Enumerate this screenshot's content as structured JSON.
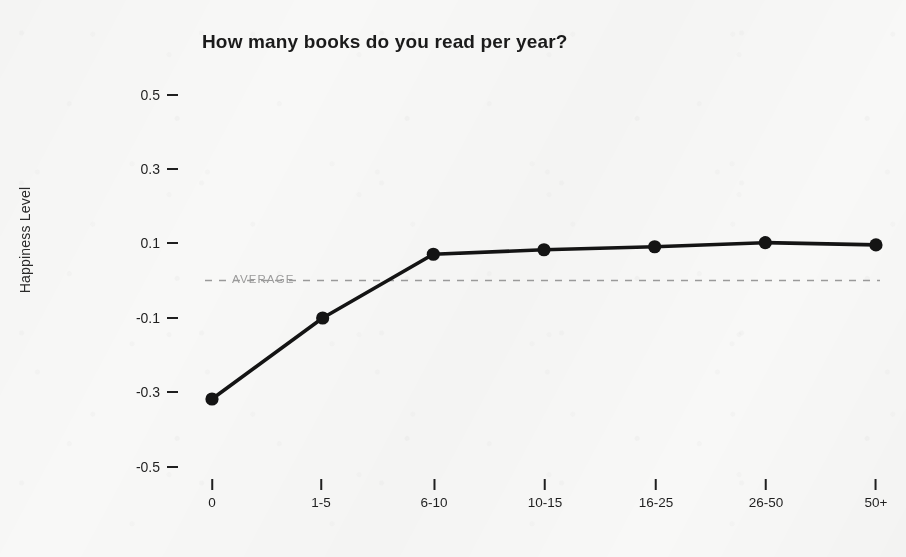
{
  "chart_data": {
    "type": "line",
    "title": "How many books do you read per year?",
    "xlabel": "",
    "ylabel": "Happiness Level",
    "categories": [
      "0",
      "1-5",
      "6-10",
      "10-15",
      "16-25",
      "26-50",
      "50+"
    ],
    "values": [
      -0.316,
      -0.1,
      0.07,
      0.082,
      0.09,
      0.101,
      0.095
    ],
    "series": [
      {
        "name": "Happiness Level",
        "values": [
          -0.316,
          -0.1,
          0.07,
          0.082,
          0.09,
          0.101,
          0.095
        ]
      }
    ],
    "ylim": [
      -0.6,
      0.6
    ],
    "yticks": [
      "0.5",
      "0.3",
      "0.1",
      "-0.1",
      "-0.3",
      "-0.5"
    ],
    "ytick_values": [
      0.5,
      0.3,
      0.1,
      -0.1,
      -0.3,
      -0.5
    ],
    "grid": false,
    "legend": "none",
    "annotations": [
      {
        "name": "average-reference-line",
        "label": "AVERAGE",
        "value": 0.0,
        "style": "dashed"
      }
    ],
    "colors": {
      "line": "#141414",
      "marker": "#141414",
      "average_line": "#9a9a9a",
      "average_text": "#9a9a9a",
      "text": "#1f1f1f",
      "background": "#f8f8f7"
    }
  }
}
